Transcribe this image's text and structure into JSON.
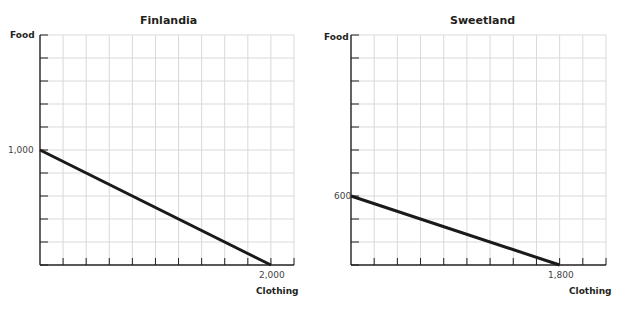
{
  "chart_data": [
    {
      "type": "line",
      "title": "Finlandia",
      "xlabel": "Clothing",
      "ylabel": "Food",
      "x": [
        0,
        2000
      ],
      "series": [
        {
          "name": "Production possibilities frontier",
          "values": [
            1000,
            0
          ]
        }
      ],
      "labeled_points": {
        "y_intercept": "1,000",
        "x_intercept": "2,000"
      },
      "xlim": [
        0,
        2200
      ],
      "ylim": [
        0,
        2000
      ],
      "grid": true,
      "grid_step_x": 200,
      "grid_step_y": 200,
      "legend": "none"
    },
    {
      "type": "line",
      "title": "Sweetland",
      "xlabel": "Clothing",
      "ylabel": "Food",
      "x": [
        0,
        1800
      ],
      "series": [
        {
          "name": "Production possibilities frontier",
          "values": [
            600,
            0
          ]
        }
      ],
      "labeled_points": {
        "y_intercept": "600",
        "x_intercept": "1,800"
      },
      "xlim": [
        0,
        2200
      ],
      "ylim": [
        0,
        2000
      ],
      "grid": true,
      "grid_step_x": 200,
      "grid_step_y": 200,
      "legend": "none"
    }
  ],
  "charts": [
    {
      "title": "Finlandia",
      "ylabel": "Food",
      "xlabel": "Clothing",
      "y_tick": "1,000",
      "x_tick": "2,000"
    },
    {
      "title": "Sweetland",
      "ylabel": "Food",
      "xlabel": "Clothing",
      "y_tick": "600",
      "x_tick": "1,800"
    }
  ],
  "colors": {
    "grid": "#d9d9d9",
    "axis": "#231f20",
    "line": "#1a1a1a"
  }
}
